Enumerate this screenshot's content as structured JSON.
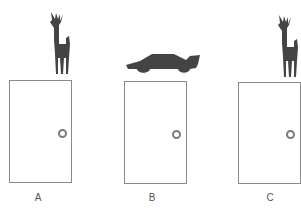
{
  "diagram": {
    "type": "monty-hall-doors",
    "colors": {
      "silhouette": "#444444",
      "door_border": "#8a8a8a",
      "knob": "#7a7a7a",
      "label": "#555555"
    },
    "doors": [
      {
        "label": "A",
        "behind": "goat"
      },
      {
        "label": "B",
        "behind": "car"
      },
      {
        "label": "C",
        "behind": "goat"
      }
    ]
  }
}
